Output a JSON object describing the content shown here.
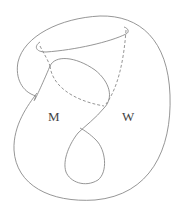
{
  "diagram": {
    "labels": {
      "m": "M",
      "w": "W"
    },
    "stroke_color": "#8a8a8a",
    "label_color": "#444444",
    "background": "#ffffff"
  }
}
